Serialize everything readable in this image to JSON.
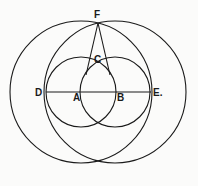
{
  "diagram": {
    "type": "geometric-construction",
    "points": {
      "D": {
        "label": "D"
      },
      "A": {
        "label": "A"
      },
      "B": {
        "label": "B"
      },
      "E": {
        "label": "E."
      },
      "F": {
        "label": "F"
      },
      "C": {
        "label": "C"
      }
    },
    "circles": [
      {
        "name": "small-circle-A",
        "center": "A",
        "through": "B"
      },
      {
        "name": "small-circle-B",
        "center": "B",
        "through": "A"
      },
      {
        "name": "large-circle-A",
        "center": "A",
        "through": "E"
      },
      {
        "name": "large-circle-B",
        "center": "B",
        "through": "D"
      }
    ],
    "segments": [
      {
        "name": "line-DE",
        "from": "D",
        "to": "E"
      },
      {
        "name": "line-FA",
        "from": "F",
        "to": "A"
      },
      {
        "name": "line-FB",
        "from": "F",
        "to": "B"
      }
    ]
  }
}
